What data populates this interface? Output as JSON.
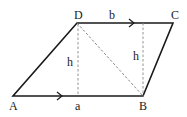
{
  "diagram": {
    "colors": {
      "stroke": "#1a1a1a",
      "dashed": "#777777",
      "text": "#222222"
    },
    "vertices": {
      "A": {
        "label": "A",
        "x": 13,
        "y": 96
      },
      "B": {
        "label": "B",
        "x": 143,
        "y": 96
      },
      "C": {
        "label": "C",
        "x": 173,
        "y": 23
      },
      "D": {
        "label": "D",
        "x": 77,
        "y": 23
      }
    },
    "side_labels": {
      "a": "a",
      "b": "b"
    },
    "height_labels": {
      "h_left": "h",
      "h_right": "h"
    }
  }
}
